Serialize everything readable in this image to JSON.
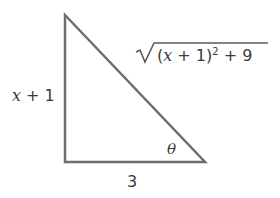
{
  "diagram": {
    "type": "right-triangle",
    "labels": {
      "vertical_leg": {
        "var": "x",
        "rest": " + 1"
      },
      "horizontal_leg": "3",
      "hypotenuse": {
        "open": "(",
        "var": "x",
        "mid": " + 1)",
        "exp": "2",
        "tail": " + 9"
      },
      "angle": "θ"
    },
    "stroke_color": "#6e6e6e"
  }
}
